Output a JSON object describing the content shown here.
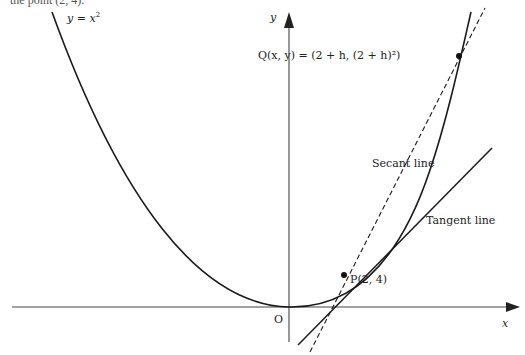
{
  "caption_fragment": "the point (2, 4).",
  "curve": {
    "label": "y = x²",
    "label_var": "y",
    "label_rest": " = x",
    "label_sup": "2"
  },
  "axes": {
    "x_label": "x",
    "y_label": "y",
    "origin_label": "O"
  },
  "points": {
    "P": {
      "label": "P(2, 4)",
      "x": 2,
      "y": 4
    },
    "Q": {
      "label": "Q(x, y) = (2 + h, (2 + h)²)",
      "x": "2 + h",
      "y": "(2 + h)²"
    }
  },
  "lines": {
    "secant": {
      "label": "Secant line",
      "style": "dashed"
    },
    "tangent": {
      "label": "Tangent line",
      "style": "solid"
    }
  },
  "colors": {
    "stroke": "#1a1a1a",
    "axis": "#444444",
    "text": "#222222"
  }
}
